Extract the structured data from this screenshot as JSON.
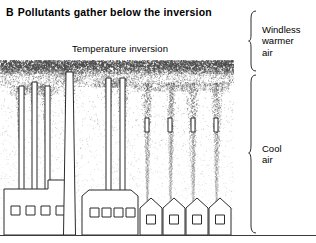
{
  "figure": {
    "panel_letter": "B",
    "title": "Pollutants gather below the inversion",
    "inversion_label": "Temperature inversion"
  },
  "zones": [
    {
      "name": "windless-warmer-air",
      "lines": [
        "Windless",
        "warmer",
        "air"
      ],
      "bracket": "curly-brace-right"
    },
    {
      "name": "cool-air",
      "lines": [
        "Cool",
        "air"
      ],
      "bracket": "curly-brace-right"
    }
  ],
  "scene": {
    "description": "Smokestack plumes rising from factories and houses, trapped and spreading beneath a dense stippled temperature-inversion layer",
    "inversion_band": {
      "top": 2,
      "height": 13,
      "density": "dense"
    },
    "colors": {
      "ink": "#2b2b2b",
      "stipple": "#4a4a4a",
      "background": "#ffffff"
    },
    "buildings": [
      {
        "name": "factory-left",
        "type": "factory-stepped",
        "x": 4,
        "windows": 4,
        "stacks": [
          {
            "x": 19,
            "top": 28,
            "width": 5
          },
          {
            "x": 32,
            "top": 24,
            "width": 5
          },
          {
            "x": 45,
            "top": 28,
            "width": 5
          }
        ]
      },
      {
        "name": "smokestack-tall",
        "type": "chimney-tall",
        "x": 66,
        "top": 14,
        "width": 7
      },
      {
        "name": "factory-center",
        "type": "factory-bevelled",
        "x": 82,
        "windows": 4,
        "stacks": [
          {
            "x": 106,
            "top": 20,
            "width": 5
          },
          {
            "x": 120,
            "top": 20,
            "width": 5
          }
        ]
      },
      {
        "name": "house-1",
        "type": "house",
        "x": 140,
        "windows": 1,
        "stacks": [
          {
            "x": 145,
            "top": 60,
            "width": 4
          }
        ]
      },
      {
        "name": "house-2",
        "type": "house",
        "x": 163,
        "windows": 1,
        "stacks": [
          {
            "x": 168,
            "top": 60,
            "width": 4
          }
        ]
      },
      {
        "name": "house-3",
        "type": "house",
        "x": 186,
        "windows": 1,
        "stacks": [
          {
            "x": 191,
            "top": 60,
            "width": 4
          }
        ]
      },
      {
        "name": "house-4",
        "type": "house",
        "x": 209,
        "windows": 1,
        "stacks": [
          {
            "x": 214,
            "top": 60,
            "width": 4
          }
        ]
      }
    ],
    "plumes": [
      {
        "x": 21,
        "base": 115,
        "top": 28,
        "spread": 9
      },
      {
        "x": 34,
        "base": 115,
        "top": 24,
        "spread": 9
      },
      {
        "x": 47,
        "base": 115,
        "top": 28,
        "spread": 9
      },
      {
        "x": 69,
        "base": 115,
        "top": 14,
        "spread": 11
      },
      {
        "x": 108,
        "base": 115,
        "top": 20,
        "spread": 11
      },
      {
        "x": 122,
        "base": 115,
        "top": 20,
        "spread": 11
      },
      {
        "x": 147,
        "base": 150,
        "top": 24,
        "spread": 10
      },
      {
        "x": 170,
        "base": 150,
        "top": 24,
        "spread": 10
      },
      {
        "x": 193,
        "base": 150,
        "top": 24,
        "spread": 10
      },
      {
        "x": 216,
        "base": 150,
        "top": 24,
        "spread": 10
      }
    ]
  }
}
